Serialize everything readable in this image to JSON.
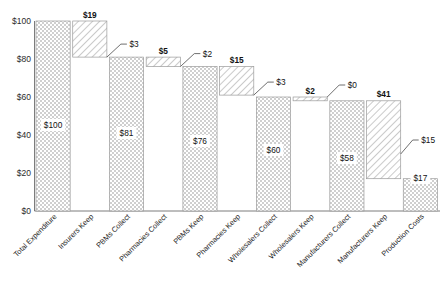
{
  "chart_data": {
    "type": "bar",
    "chart_variant": "waterfall",
    "title": "",
    "subtitle": "",
    "xlabel": "",
    "ylabel": "",
    "ylim": [
      0,
      100
    ],
    "yticks": [
      0,
      20,
      40,
      60,
      80,
      100
    ],
    "ytick_labels": [
      "$0",
      "$20",
      "$40",
      "$60",
      "$80",
      "$100"
    ],
    "grid": false,
    "legend": null,
    "currency_prefix": "$",
    "categories": [
      "Total Expenditure",
      "Insurers Keep",
      "PBMs Collect",
      "Pharmacies Collect",
      "PBMs Keep",
      "Pharmacies Keep",
      "Wholesalers Collect",
      "Wholesalers Keep",
      "Manufacturers Collect",
      "Manufacturers Keep",
      "Production Costs"
    ],
    "bars": [
      {
        "category": "Total Expenditure",
        "kind": "total",
        "fill": "checker",
        "base": 0,
        "top": 100,
        "value": 100,
        "value_label": "$100",
        "value_label_inside": true,
        "delta_label": "",
        "callout_label": "",
        "callout": false
      },
      {
        "category": "Insurers Keep",
        "kind": "delta",
        "fill": "hatch",
        "base": 81,
        "top": 100,
        "value": 19,
        "value_label": "",
        "value_label_inside": false,
        "delta_label": "$19",
        "callout_label": "",
        "callout": false
      },
      {
        "category": "PBMs Collect",
        "kind": "total",
        "fill": "checker",
        "base": 0,
        "top": 81,
        "value": 81,
        "value_label": "$81",
        "value_label_inside": true,
        "delta_label": "",
        "callout_label": "",
        "callout": false
      },
      {
        "category": "Pharmacies Collect",
        "kind": "delta",
        "fill": "hatch",
        "base": 76,
        "top": 81,
        "value": 5,
        "value_label": "",
        "value_label_inside": false,
        "delta_label": "$5",
        "callout_label": "",
        "callout": false
      },
      {
        "category": "PBMs Keep",
        "kind": "total",
        "fill": "checker",
        "base": 0,
        "top": 76,
        "value": 76,
        "value_label": "$76",
        "value_label_inside": true,
        "delta_label": "",
        "callout_label": "",
        "callout": false
      },
      {
        "category": "Pharmacies Keep",
        "kind": "delta",
        "fill": "hatch",
        "base": 61,
        "top": 76,
        "value": 15,
        "value_label": "",
        "value_label_inside": false,
        "delta_label": "$15",
        "callout_label": "",
        "callout": false
      },
      {
        "category": "Wholesalers Collect",
        "kind": "total",
        "fill": "checker",
        "base": 0,
        "top": 60,
        "value": 60,
        "value_label": "$60",
        "value_label_inside": true,
        "delta_label": "",
        "callout_label": "",
        "callout": false
      },
      {
        "category": "Wholesalers Keep",
        "kind": "delta",
        "fill": "hatch",
        "base": 58,
        "top": 60,
        "value": 2,
        "value_label": "",
        "value_label_inside": false,
        "delta_label": "$2",
        "callout_label": "",
        "callout": false
      },
      {
        "category": "Manufacturers Collect",
        "kind": "total",
        "fill": "checker",
        "base": 0,
        "top": 58,
        "value": 58,
        "value_label": "$58",
        "value_label_inside": true,
        "delta_label": "",
        "callout_label": "",
        "callout": false
      },
      {
        "category": "Manufacturers Keep",
        "kind": "delta",
        "fill": "hatch",
        "base": 17,
        "top": 58,
        "value": 41,
        "value_label": "",
        "value_label_inside": false,
        "delta_label": "$41",
        "callout_label": "",
        "callout": false
      },
      {
        "category": "Production Costs",
        "kind": "total",
        "fill": "checker",
        "base": 0,
        "top": 17,
        "value": 17,
        "value_label": "$17",
        "value_label_inside": true,
        "delta_label": "",
        "callout_label": "",
        "callout": false
      }
    ],
    "callouts": [
      {
        "label": "$3",
        "value": 3,
        "note": "Insurers pass-through gap between Insurers Keep and PBMs Collect"
      },
      {
        "label": "$2",
        "value": 2,
        "note": "Gap between Pharmacies Collect and PBMs Keep"
      },
      {
        "label": "$3",
        "value": 3,
        "note": "Gap between Pharmacies Keep and Wholesalers Collect"
      },
      {
        "label": "$0",
        "value": 0,
        "note": "Gap between Wholesalers Keep and Manufacturers Collect"
      },
      {
        "label": "$15",
        "value": 15,
        "note": "Gap pointing at Manufacturers Keep lower region / Production Costs"
      }
    ],
    "colors": {
      "checker_fill": "#d9d9d9",
      "hatch_fill": "#ffffff",
      "hatch_stroke": "#9e9e9e",
      "bar_outline": "#9a9a9a",
      "axis": "#5a5a5a",
      "text": "#111111",
      "background": "#ffffff"
    }
  }
}
